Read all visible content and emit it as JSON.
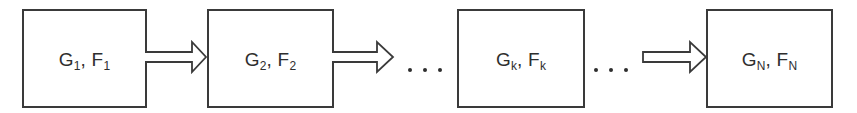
{
  "diagram": {
    "type": "sequential-flow",
    "stages": [
      {
        "id": "stage-1",
        "g": "G",
        "g_sub": "1",
        "sep": ", ",
        "f": "F",
        "f_sub": "1"
      },
      {
        "id": "stage-2",
        "g": "G",
        "g_sub": "2",
        "sep": ", ",
        "f": "F",
        "f_sub": "2"
      },
      {
        "id": "stage-k",
        "g": "G",
        "g_sub": "k",
        "sep": ", ",
        "f": "F",
        "f_sub": "k"
      },
      {
        "id": "stage-N",
        "g": "G",
        "g_sub": "N",
        "sep": ", ",
        "f": "F",
        "f_sub": "N"
      }
    ],
    "connectors": [
      {
        "from": "stage-1",
        "to": "stage-2",
        "style": "hollow-block-arrow"
      },
      {
        "from": "stage-2",
        "to": "ellipsis",
        "style": "hollow-block-arrow"
      },
      {
        "from": "ellipsis",
        "to": "stage-k",
        "style": "dots"
      },
      {
        "from": "stage-k",
        "to": "ellipsis",
        "style": "dots"
      },
      {
        "from": "ellipsis",
        "to": "stage-N",
        "style": "hollow-block-arrow"
      }
    ],
    "line_color": "#3a3a3a",
    "text_color": "#2e2e2e"
  }
}
